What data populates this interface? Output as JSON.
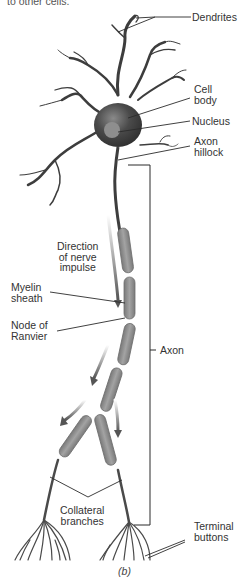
{
  "caption_top": "to other cells.",
  "labels": {
    "dendrites": "Dendrites",
    "cell_body": "Cell\nbody",
    "nucleus": "Nucleus",
    "axon_hillock": "Axon\nhillock",
    "direction": "Direction\nof nerve\nimpulse",
    "myelin_sheath": "Myelin\nsheath",
    "node_of_ranvier": "Node of\nRanvier",
    "axon": "Axon",
    "collateral_branches": "Collateral\nbranches",
    "terminal_buttons": "Terminal\nbuttons"
  },
  "figure_label": "(b)",
  "colors": {
    "cell": "#3d3d3d",
    "myelin": "#8a8a8a",
    "nucleus": "#8e8e8e",
    "line": "#2b2b2b"
  }
}
